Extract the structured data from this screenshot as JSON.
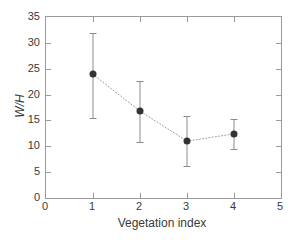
{
  "chart_data": {
    "type": "line",
    "title": "",
    "subtitle": "",
    "xlabel": "Vegetation index",
    "ylabel": "W/H",
    "xlim": [
      0,
      5
    ],
    "ylim": [
      0,
      35
    ],
    "xticks": [
      0,
      1,
      2,
      3,
      4,
      5
    ],
    "yticks": [
      0,
      5,
      10,
      15,
      20,
      25,
      30,
      35
    ],
    "xticklabels": [
      "0",
      "1",
      "2",
      "3",
      "4",
      "5"
    ],
    "yticklabels": [
      "0",
      "5",
      "10",
      "15",
      "20",
      "25",
      "30",
      "35"
    ],
    "grid": false,
    "legend": null,
    "linestyle": "dotted",
    "marker": "filled-circle",
    "error_bars": true,
    "x": [
      1,
      2,
      3,
      4
    ],
    "values": [
      23.9,
      16.8,
      11.0,
      12.4
    ],
    "err_low": [
      15.5,
      10.8,
      6.2,
      9.5
    ],
    "err_high": [
      32.0,
      22.6,
      15.8,
      15.3
    ],
    "series": [
      {
        "name": "W/H",
        "points": [
          {
            "x": 1,
            "y": 23.9,
            "low": 15.5,
            "high": 32.0
          },
          {
            "x": 2,
            "y": 16.8,
            "low": 10.8,
            "high": 22.6
          },
          {
            "x": 3,
            "y": 11.0,
            "low": 6.2,
            "high": 15.8
          },
          {
            "x": 4,
            "y": 12.4,
            "low": 9.5,
            "high": 15.3
          }
        ]
      }
    ],
    "colors": {
      "marker": "#333333",
      "errorbar": "#8d8d8d",
      "line": "#9a9a9a",
      "axis": "#9a9a9a",
      "text": "#3a3a3a",
      "background": "#ffffff"
    }
  }
}
